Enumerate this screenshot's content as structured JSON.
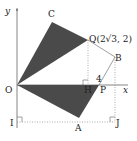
{
  "diagram": {
    "type": "geometry",
    "axes": {
      "x_label": "x",
      "y_label": "y",
      "origin_label": "O"
    },
    "points": {
      "O": {
        "label": "O"
      },
      "C": {
        "label": "C"
      },
      "Q": {
        "label": "Q(2√3, 2)"
      },
      "B": {
        "label": "B"
      },
      "P": {
        "label": "P"
      },
      "H": {
        "label": "H"
      },
      "A": {
        "label": "A"
      },
      "I": {
        "label": "I"
      },
      "J": {
        "label": "J"
      }
    },
    "tick_label_4": "4",
    "shaded_triangles": [
      "OCQ",
      "OAP"
    ],
    "colors": {
      "fill": "#4a4a4a",
      "line": "#555555",
      "dotted": "#888888"
    }
  }
}
